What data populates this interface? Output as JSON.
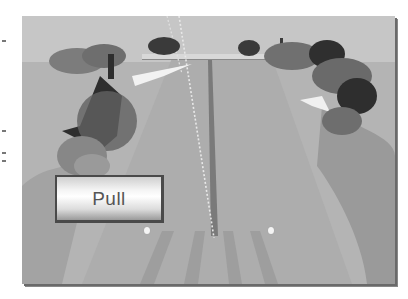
{
  "game": {
    "scene": "shooting-range-lane",
    "palette": {
      "sky": "#c6c6c6",
      "ground": "#b4b4b4",
      "path": "#a9a9a9",
      "rough": "#9c9c9c",
      "tree_dark": "#2e2e2e",
      "tree_mid": "#6f6f6f",
      "center_line": "#777777",
      "trajectory": "#e8e8e8"
    },
    "controls": {
      "pull_button": {
        "label": "Pull"
      }
    },
    "markers": [
      {
        "name": "left-marker",
        "x": 146,
        "y": 230
      },
      {
        "name": "right-marker",
        "x": 271,
        "y": 230
      }
    ]
  }
}
